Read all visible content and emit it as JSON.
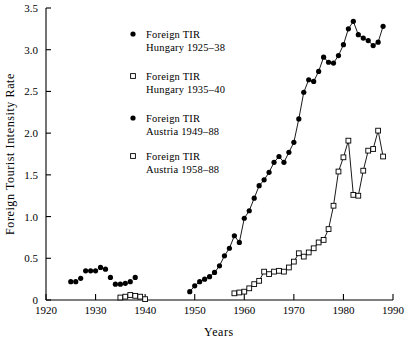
{
  "chart_data": {
    "type": "line",
    "title": "",
    "xlabel": "Years",
    "ylabel": "Foreign Tourist Intensity Rate",
    "xlim": [
      1920,
      1990
    ],
    "ylim": [
      0,
      3.5
    ],
    "xticks": [
      1920,
      1930,
      1940,
      1950,
      1960,
      1970,
      1980,
      1990
    ],
    "xtick_labels": [
      "1920",
      "1930",
      "1940",
      "1950",
      "1960",
      "1970",
      "1980",
      "1990"
    ],
    "yticks": [
      0,
      0.5,
      1.0,
      1.5,
      2.0,
      2.5,
      3.0,
      3.5
    ],
    "ytick_labels": [
      "0",
      "0.5",
      "1.0",
      "1.5",
      "2.0",
      "2.5",
      "3.0",
      "3.5"
    ],
    "grid": false,
    "legend_position": "upper-left-inside",
    "series": [
      {
        "name": "Foreign TIR Hungary 1925–38",
        "label_line1": "Foreign TIR",
        "label_line2": "Hungary 1925–38",
        "marker": "filled-circle",
        "color": "#000000",
        "connected": false,
        "x": [
          1925,
          1926,
          1927,
          1928,
          1929,
          1930,
          1931,
          1932,
          1933,
          1934,
          1935,
          1936,
          1937,
          1938
        ],
        "values": [
          0.22,
          0.22,
          0.26,
          0.35,
          0.35,
          0.35,
          0.39,
          0.37,
          0.27,
          0.19,
          0.19,
          0.2,
          0.22,
          0.27
        ]
      },
      {
        "name": "Foreign TIR Hungary 1935–40",
        "label_line1": "Foreign TIR",
        "label_line2": "Hungary 1935–40",
        "marker": "open-square",
        "color": "#000000",
        "connected": false,
        "x": [
          1935,
          1936,
          1937,
          1938,
          1939,
          1940
        ],
        "values": [
          0.03,
          0.04,
          0.06,
          0.05,
          0.04,
          0.01
        ]
      },
      {
        "name": "Foreign TIR Austria 1949–88",
        "label_line1": "Foreign TIR",
        "label_line2": "Austria 1949–88",
        "marker": "filled-circle",
        "color": "#000000",
        "connected": true,
        "x": [
          1949,
          1950,
          1951,
          1952,
          1953,
          1954,
          1955,
          1956,
          1957,
          1958,
          1959,
          1960,
          1961,
          1962,
          1963,
          1964,
          1965,
          1966,
          1967,
          1968,
          1969,
          1970,
          1971,
          1972,
          1973,
          1974,
          1975,
          1976,
          1977,
          1978,
          1979,
          1980,
          1981,
          1982,
          1983,
          1984,
          1985,
          1986,
          1987,
          1988
        ],
        "values": [
          0.1,
          0.17,
          0.22,
          0.25,
          0.28,
          0.33,
          0.41,
          0.53,
          0.62,
          0.77,
          0.69,
          0.98,
          1.07,
          1.22,
          1.37,
          1.44,
          1.53,
          1.65,
          1.72,
          1.65,
          1.77,
          1.89,
          2.17,
          2.49,
          2.64,
          2.62,
          2.74,
          2.91,
          2.85,
          2.84,
          2.93,
          3.06,
          3.25,
          3.34,
          3.18,
          3.14,
          3.11,
          3.05,
          3.09,
          3.28
        ]
      },
      {
        "name": "Foreign TIR Austria 1958–88",
        "label_line1": "Foreign TIR",
        "label_line2": "Austria 1958–88",
        "marker": "open-square",
        "color": "#000000",
        "connected": true,
        "x": [
          1958,
          1959,
          1960,
          1961,
          1962,
          1963,
          1964,
          1965,
          1966,
          1967,
          1968,
          1969,
          1970,
          1971,
          1972,
          1973,
          1974,
          1975,
          1976,
          1977,
          1978,
          1979,
          1980,
          1981,
          1982,
          1983,
          1984,
          1985,
          1986,
          1987,
          1988
        ],
        "values": [
          0.08,
          0.09,
          0.1,
          0.14,
          0.19,
          0.23,
          0.34,
          0.31,
          0.34,
          0.35,
          0.34,
          0.39,
          0.46,
          0.56,
          0.52,
          0.57,
          0.62,
          0.69,
          0.72,
          0.85,
          1.13,
          1.54,
          1.71,
          1.91,
          1.26,
          1.25,
          1.55,
          1.79,
          1.81,
          2.03,
          1.72
        ]
      }
    ]
  },
  "axes": {
    "x_title": "Years",
    "y_title": "Foreign Tourist Intensity Rate"
  }
}
